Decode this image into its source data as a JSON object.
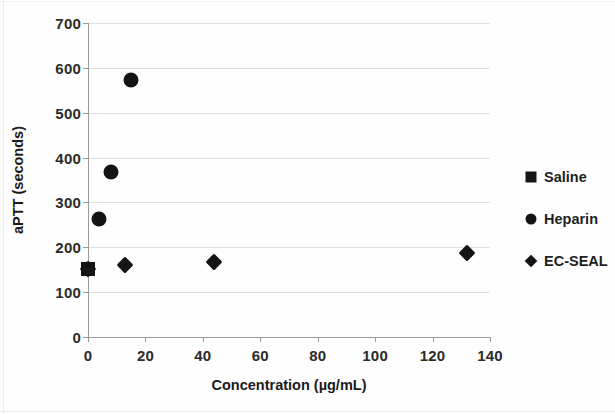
{
  "chart_data": {
    "type": "scatter",
    "title": "",
    "xlabel": "Concentration (µg/mL)",
    "ylabel": "aPTT (seconds)",
    "xlim": [
      0,
      140
    ],
    "ylim": [
      0,
      700
    ],
    "xticks": [
      "0",
      "20",
      "40",
      "60",
      "80",
      "100",
      "120",
      "140"
    ],
    "yticks": [
      "0",
      "100",
      "200",
      "300",
      "400",
      "500",
      "600",
      "700"
    ],
    "grid": "horizontal",
    "legend_position": "right",
    "series": [
      {
        "name": "Saline",
        "marker": "square",
        "color": "#141414",
        "points": [
          {
            "x": 0,
            "y": 152
          }
        ]
      },
      {
        "name": "Heparin",
        "marker": "circle",
        "color": "#141414",
        "points": [
          {
            "x": 4,
            "y": 262
          },
          {
            "x": 8,
            "y": 368
          },
          {
            "x": 15,
            "y": 572
          }
        ]
      },
      {
        "name": "EC-SEAL",
        "marker": "diamond",
        "color": "#141414",
        "points": [
          {
            "x": 0,
            "y": 152
          },
          {
            "x": 13,
            "y": 161
          },
          {
            "x": 44,
            "y": 167
          },
          {
            "x": 132,
            "y": 187
          }
        ]
      }
    ]
  }
}
